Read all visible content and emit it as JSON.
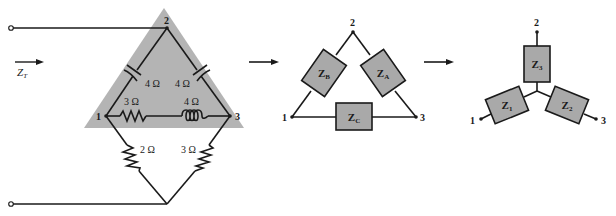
{
  "figure": {
    "colors": {
      "shade": "#b4b4b4",
      "box_fill": "#a9a9a9",
      "line": "#1a1a1a",
      "background": "#ffffff"
    }
  },
  "left_network": {
    "input_label": "Z",
    "input_label_sub": "T",
    "nodes": {
      "n1": "1",
      "n2": "2",
      "n3": "3"
    },
    "components": [
      {
        "id": "cap_12",
        "type": "capacitor",
        "value": "4 Ω",
        "between": [
          "1",
          "2"
        ]
      },
      {
        "id": "cap_23",
        "type": "capacitor",
        "value": "4 Ω",
        "between": [
          "2",
          "3"
        ]
      },
      {
        "id": "res_13",
        "type": "resistor",
        "value": "3 Ω",
        "between": [
          "1",
          "3"
        ]
      },
      {
        "id": "ind_13",
        "type": "inductor",
        "value": "4 Ω",
        "between": [
          "1",
          "3"
        ]
      },
      {
        "id": "res_1b",
        "type": "resistor",
        "value": "2 Ω",
        "between": [
          "1",
          "bottom"
        ]
      },
      {
        "id": "res_3b",
        "type": "resistor",
        "value": "3 Ω",
        "between": [
          "3",
          "bottom"
        ]
      }
    ]
  },
  "delta_network": {
    "nodes": {
      "n1": "1",
      "n2": "2",
      "n3": "3"
    },
    "impedances": {
      "za": {
        "main": "Z",
        "sub": "A"
      },
      "zb": {
        "main": "Z",
        "sub": "B"
      },
      "zc": {
        "main": "Z",
        "sub": "C"
      }
    }
  },
  "y_network": {
    "nodes": {
      "n1": "1",
      "n2": "2",
      "n3": "3"
    },
    "impedances": {
      "z1": {
        "main": "Z",
        "sub": "1"
      },
      "z2": {
        "main": "Z",
        "sub": "2"
      },
      "z3": {
        "main": "Z",
        "sub": "3"
      }
    }
  }
}
